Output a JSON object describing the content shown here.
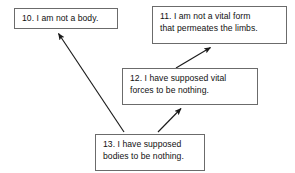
{
  "diagram": {
    "type": "argument-map",
    "background_color": "#ffffff",
    "box_border_color": "#6b6b6b",
    "text_color": "#111111",
    "arrow_color": "#1a1a1a",
    "nodes": [
      {
        "id": "10",
        "number": "10.",
        "text": "10. I am not a body.",
        "x": 14,
        "y": 8,
        "width": 104,
        "height": 21
      },
      {
        "id": "11",
        "number": "11.",
        "text": "11. I am not a vital form\nthat permeates the limbs.",
        "x": 152,
        "y": 6,
        "width": 135,
        "height": 38
      },
      {
        "id": "12",
        "number": "12.",
        "text": "12. I have supposed vital\nforces to be nothing.",
        "x": 122,
        "y": 68,
        "width": 136,
        "height": 37
      },
      {
        "id": "13",
        "number": "13.",
        "text": "13. I have supposed\nbodies to be nothing.",
        "x": 95,
        "y": 134,
        "width": 110,
        "height": 37
      }
    ],
    "edges": [
      {
        "id": "edge-13-to-10",
        "from": "13",
        "to": "10",
        "x1": 124,
        "y1": 132,
        "x2": 57,
        "y2": 32
      },
      {
        "id": "edge-13-to-12",
        "from": "13",
        "to": "12",
        "x1": 158,
        "y1": 132,
        "x2": 182,
        "y2": 107
      },
      {
        "id": "edge-12-to-11",
        "from": "12",
        "to": "11",
        "x1": 176,
        "y1": 68,
        "x2": 212,
        "y2": 46
      }
    ]
  }
}
